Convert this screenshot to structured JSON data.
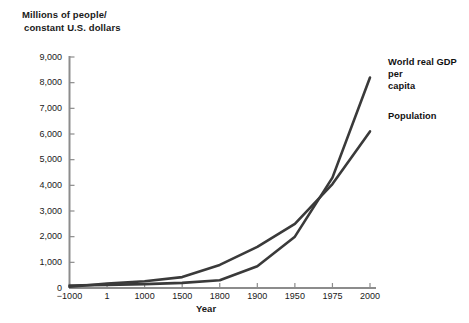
{
  "chart_data": {
    "type": "line",
    "title": "",
    "ylabel": "Millions of people/\nconstant U.S. dollars",
    "ylabel_line1": "Millions of people/",
    "ylabel_line2": "constant U.S. dollars",
    "xlabel": "Year",
    "categories": [
      "−1000",
      "1",
      "1000",
      "1500",
      "1800",
      "1900",
      "1950",
      "1975",
      "2000"
    ],
    "x_tick_labels": [
      "−1000",
      "1",
      "1000",
      "1500",
      "1800",
      "1900",
      "1950",
      "1975",
      "2000"
    ],
    "y_tick_labels": [
      "0",
      "1,000",
      "2,000",
      "3,000",
      "4,000",
      "5,000",
      "6,000",
      "7,000",
      "8,000",
      "9,000"
    ],
    "y_tick_values": [
      0,
      1000,
      2000,
      3000,
      4000,
      5000,
      6000,
      7000,
      8000,
      9000
    ],
    "ylim": [
      0,
      9000
    ],
    "grid": false,
    "legend_position": "inline-right-annotations",
    "series": [
      {
        "name": "World real GDP per capita",
        "label_text": "World real GDP per\ncapita",
        "color": "#3a3a3a",
        "values": [
          100,
          120,
          150,
          200,
          300,
          850,
          2000,
          4300,
          8200
        ]
      },
      {
        "name": "Population",
        "label_text": "Population",
        "color": "#3a3a3a",
        "values": [
          50,
          170,
          265,
          425,
          900,
          1600,
          2500,
          4050,
          6100
        ]
      }
    ],
    "axis_color": "#8c8c8c",
    "line_color": "#3a3a3a",
    "background": "#ffffff"
  },
  "annotations": {
    "gdp_label": "World real GDP per\ncapita",
    "population_label": "Population"
  }
}
